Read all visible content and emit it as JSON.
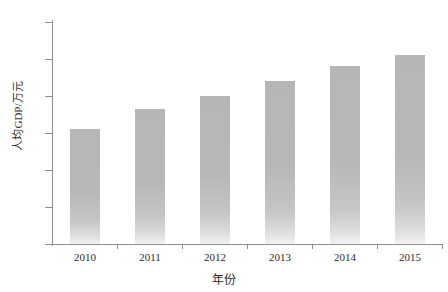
{
  "chart_data": {
    "type": "bar",
    "title": "",
    "categories": [
      "2010",
      "2011",
      "2012",
      "2013",
      "2014",
      "2015"
    ],
    "values": [
      3.1,
      3.65,
      4.0,
      4.4,
      4.8,
      5.1
    ],
    "series": [
      {
        "name": "人均GDP",
        "values": [
          3.1,
          3.65,
          4.0,
          4.4,
          4.8,
          5.1
        ]
      }
    ],
    "xlabel": "年份",
    "ylabel": "人均GDP/万元",
    "ylim": [
      0,
      6
    ],
    "yticks": [
      0,
      1,
      2,
      3,
      4,
      5,
      6
    ],
    "ytick_labels": [
      "0",
      "1",
      "2",
      "3",
      "4",
      "5",
      "6"
    ],
    "xlim": [
      0,
      6
    ],
    "grid": false,
    "legend": false,
    "bar_color": "#b8b8b8",
    "axis_color": "#8e8e8e",
    "text_color": "#2b2b2b"
  },
  "axis": {
    "y_title": "人均GDP/万元",
    "x_title": "年份"
  }
}
